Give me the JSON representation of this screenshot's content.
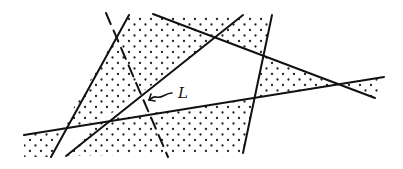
{
  "diagram": {
    "label": "L",
    "colors": {
      "line": "#111111",
      "dot": "#222222",
      "background": "#ffffff"
    },
    "lines": [
      {
        "id": "line-a",
        "x1": 129,
        "y1": 15,
        "x2": 51,
        "y2": 157,
        "style": "solid"
      },
      {
        "id": "line-b",
        "x1": 243,
        "y1": 15,
        "x2": 66,
        "y2": 156,
        "style": "solid"
      },
      {
        "id": "line-dashed",
        "x1": 106,
        "y1": 13,
        "x2": 168,
        "y2": 157,
        "style": "dashed"
      },
      {
        "id": "line-c",
        "x1": 153,
        "y1": 14,
        "x2": 375,
        "y2": 98,
        "style": "solid"
      },
      {
        "id": "line-d",
        "x1": 24,
        "y1": 135,
        "x2": 384,
        "y2": 77,
        "style": "solid"
      },
      {
        "id": "line-e",
        "x1": 272,
        "y1": 15,
        "x2": 243,
        "y2": 153,
        "style": "solid"
      }
    ]
  }
}
